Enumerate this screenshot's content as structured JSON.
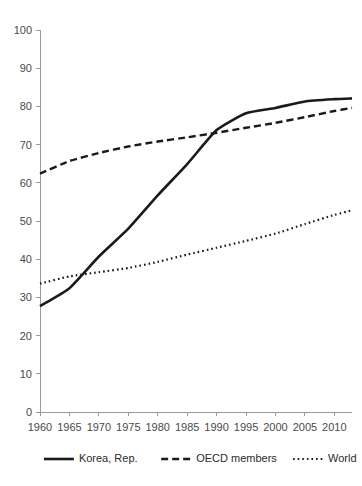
{
  "chart_data": {
    "type": "line",
    "title": "",
    "subtitle": "",
    "xlabel": "",
    "ylabel": "",
    "xlim": [
      1960,
      2013
    ],
    "ylim": [
      0,
      100
    ],
    "grid": false,
    "legend_position": "bottom",
    "x_tick_labels": [
      "1960",
      "1965",
      "1970",
      "1975",
      "1980",
      "1985",
      "1990",
      "1995",
      "2000",
      "2005",
      "2010"
    ],
    "x_tick_values": [
      1960,
      1965,
      1970,
      1975,
      1980,
      1985,
      1990,
      1995,
      2000,
      2005,
      2010
    ],
    "y_tick_labels": [
      "0",
      "10",
      "20",
      "30",
      "40",
      "50",
      "60",
      "70",
      "80",
      "90",
      "100"
    ],
    "y_tick_values": [
      0,
      10,
      20,
      30,
      40,
      50,
      60,
      70,
      80,
      90,
      100
    ],
    "x": [
      1960,
      1965,
      1970,
      1975,
      1980,
      1985,
      1990,
      1995,
      2000,
      2005,
      2010,
      2013
    ],
    "series": [
      {
        "name": "Korea, Rep.",
        "style": "solid",
        "color": "#1a1a1a",
        "values": [
          27.7,
          32.4,
          40.7,
          48.0,
          56.7,
          64.9,
          73.8,
          78.2,
          79.6,
          81.3,
          81.9,
          82.1
        ]
      },
      {
        "name": "OECD members",
        "style": "dashed",
        "color": "#1a1a1a",
        "values": [
          62.4,
          65.7,
          67.8,
          69.5,
          70.8,
          71.9,
          73.1,
          74.4,
          75.7,
          77.2,
          78.8,
          79.6
        ]
      },
      {
        "name": "World",
        "style": "dotted",
        "color": "#1a1a1a",
        "values": [
          33.6,
          35.5,
          36.6,
          37.7,
          39.3,
          41.2,
          43.0,
          44.8,
          46.7,
          49.2,
          51.6,
          52.8
        ]
      }
    ]
  },
  "legend": {
    "items": [
      {
        "label": "Korea, Rep."
      },
      {
        "label": "OECD members"
      },
      {
        "label": "World"
      }
    ]
  }
}
